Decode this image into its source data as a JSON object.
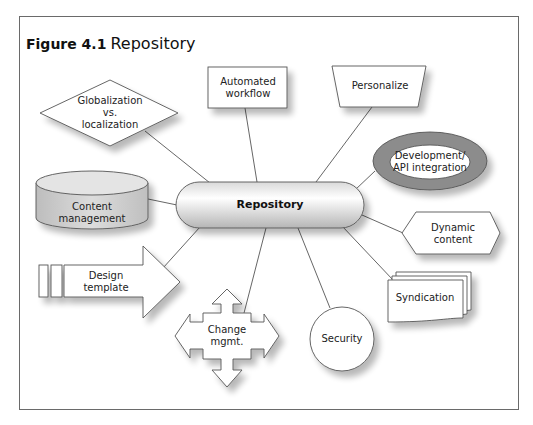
{
  "figure": {
    "number": "Figure 4.1",
    "title": "Repository"
  },
  "center_node": {
    "label": "Repository",
    "shape": "pill"
  },
  "nodes": [
    {
      "id": "globalization",
      "label_lines": [
        "Globalization",
        "vs.",
        "localization"
      ],
      "shape": "diamond"
    },
    {
      "id": "automated-workflow",
      "label_lines": [
        "Automated",
        "workflow"
      ],
      "shape": "rectangle"
    },
    {
      "id": "personalize",
      "label_lines": [
        "Personalize"
      ],
      "shape": "trapezoid"
    },
    {
      "id": "development-api",
      "label_lines": [
        "Development/",
        "API integration"
      ],
      "shape": "ring-ellipse"
    },
    {
      "id": "dynamic-content",
      "label_lines": [
        "Dynamic",
        "content"
      ],
      "shape": "hexagon"
    },
    {
      "id": "syndication",
      "label_lines": [
        "Syndication"
      ],
      "shape": "multi-document"
    },
    {
      "id": "security",
      "label_lines": [
        "Security"
      ],
      "shape": "circle"
    },
    {
      "id": "change-mgmt",
      "label_lines": [
        "Change",
        "mgmt."
      ],
      "shape": "four-way-arrow"
    },
    {
      "id": "design-template",
      "label_lines": [
        "Design",
        "template"
      ],
      "shape": "striped-arrow"
    },
    {
      "id": "content-management",
      "label_lines": [
        "Content",
        "management"
      ],
      "shape": "cylinder"
    }
  ],
  "colors": {
    "stroke": "#555555",
    "ring_fill": "#8c8c8c",
    "pill_gradient_light": "#ffffff",
    "pill_gradient_dark": "#bdbdbd",
    "cylinder_fill": "#cfcfcf",
    "shadow": "#d6d6d6"
  }
}
